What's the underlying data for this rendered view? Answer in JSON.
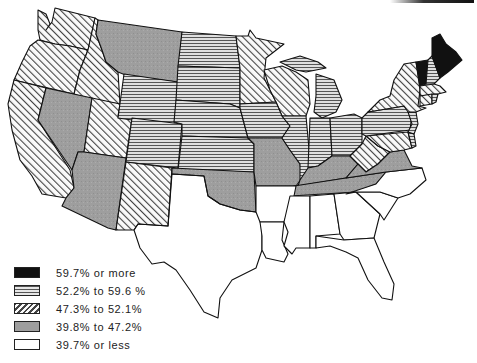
{
  "map": {
    "title": "",
    "region": "Contiguous United States",
    "classes": [
      {
        "id": "c1",
        "label": "59.7% or more",
        "pattern": "solid-black",
        "color": "#111111"
      },
      {
        "id": "c2",
        "label": "52.2% to 59.6 %",
        "pattern": "horizontal-lines",
        "color": "#8a8a8a"
      },
      {
        "id": "c3",
        "label": "47.3% to 52.1%",
        "pattern": "diagonal-lines",
        "color": "#8a8a8a"
      },
      {
        "id": "c4",
        "label": "39.8% to 47.2%",
        "pattern": "gray-fill",
        "color": "#a0a0a0"
      },
      {
        "id": "c5",
        "label": "39.7% or less",
        "pattern": "white",
        "color": "#ffffff"
      }
    ],
    "states": {
      "WA": "c3",
      "OR": "c3",
      "ID": "c3",
      "CA": "c3",
      "UT": "c3",
      "NM": "c3",
      "MN": "c3",
      "WI": "c3",
      "NY": "c3",
      "WV": "c3",
      "MD": "c3",
      "MA": "c3",
      "CT": "c3",
      "NV": "c4",
      "AZ": "c4",
      "MT": "c4",
      "OK": "c4",
      "MO": "c4",
      "KY": "c4",
      "TN": "c4",
      "VA": "c4",
      "WY": "c2",
      "CO": "c2",
      "ND": "c2",
      "SD": "c2",
      "NE": "c2",
      "KS": "c2",
      "IA": "c2",
      "IL": "c2",
      "IN": "c2",
      "MI": "c2",
      "OH": "c2",
      "PA": "c2",
      "NH": "c2",
      "NJ": "c2",
      "DE": "c2",
      "RI": "c2",
      "ME": "c1",
      "VT": "c1",
      "TX": "c5",
      "AR": "c5",
      "LA": "c5",
      "MS": "c5",
      "AL": "c5",
      "GA": "c5",
      "FL": "c5",
      "SC": "c5",
      "NC": "c5"
    }
  },
  "legend": {
    "items": [
      {
        "label": "59.7% or more"
      },
      {
        "label": "52.2% to 59.6 %"
      },
      {
        "label": "47.3% to 52.1%"
      },
      {
        "label": "39.8% to 47.2%"
      },
      {
        "label": "39.7% or less"
      }
    ]
  }
}
